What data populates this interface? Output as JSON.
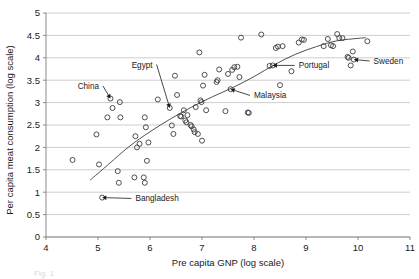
{
  "chart_data": {
    "type": "scatter",
    "title": "",
    "xlabel": "Pre capita GNP (log scale)",
    "ylabel": "Per capita meat consumption (log scale)",
    "xlim": [
      4,
      11
    ],
    "ylim": [
      0,
      5
    ],
    "xticks": [
      "4",
      "5",
      "6",
      "7",
      "8",
      "9",
      "10",
      "11"
    ],
    "yticks": [
      "0",
      "0.5",
      "1",
      "1.5",
      "2",
      "2.5",
      "3",
      "3.5",
      "4",
      "4.5",
      "5"
    ],
    "grid": "horizontal",
    "legend": "none",
    "marker_style": "open-circle",
    "points": [
      [
        4.51,
        1.72
      ],
      [
        4.97,
        2.29
      ],
      [
        5.02,
        1.62
      ],
      [
        5.08,
        0.88
      ],
      [
        5.18,
        2.67
      ],
      [
        5.24,
        3.09
      ],
      [
        5.28,
        2.88
      ],
      [
        5.38,
        1.47
      ],
      [
        5.4,
        1.21
      ],
      [
        5.42,
        3.01
      ],
      [
        5.43,
        2.67
      ],
      [
        5.7,
        1.33
      ],
      [
        5.72,
        2.25
      ],
      [
        5.75,
        2.0
      ],
      [
        5.8,
        2.08
      ],
      [
        5.88,
        1.33
      ],
      [
        5.9,
        2.67
      ],
      [
        5.9,
        1.21
      ],
      [
        5.92,
        2.45
      ],
      [
        5.94,
        1.7
      ],
      [
        5.97,
        2.11
      ],
      [
        6.15,
        3.07
      ],
      [
        6.38,
        2.88
      ],
      [
        6.42,
        2.49
      ],
      [
        6.45,
        2.3
      ],
      [
        6.48,
        3.6
      ],
      [
        6.52,
        3.17
      ],
      [
        6.58,
        2.7
      ],
      [
        6.6,
        2.69
      ],
      [
        6.65,
        2.83
      ],
      [
        6.68,
        2.6
      ],
      [
        6.7,
        2.56
      ],
      [
        6.72,
        2.72
      ],
      [
        6.78,
        2.5
      ],
      [
        6.8,
        2.47
      ],
      [
        6.84,
        2.4
      ],
      [
        6.86,
        2.34
      ],
      [
        6.88,
        2.9
      ],
      [
        6.92,
        2.3
      ],
      [
        6.95,
        4.12
      ],
      [
        6.97,
        3.05
      ],
      [
        6.99,
        3.01
      ],
      [
        7.0,
        2.15
      ],
      [
        7.02,
        3.38
      ],
      [
        7.05,
        3.62
      ],
      [
        7.08,
        2.83
      ],
      [
        7.28,
        3.46
      ],
      [
        7.3,
        3.5
      ],
      [
        7.33,
        3.74
      ],
      [
        7.45,
        2.81
      ],
      [
        7.5,
        3.64
      ],
      [
        7.55,
        3.3
      ],
      [
        7.58,
        3.73
      ],
      [
        7.62,
        3.79
      ],
      [
        7.68,
        3.8
      ],
      [
        7.72,
        3.57
      ],
      [
        7.75,
        4.45
      ],
      [
        7.88,
        2.78
      ],
      [
        7.9,
        2.77
      ],
      [
        8.14,
        4.52
      ],
      [
        8.3,
        3.82
      ],
      [
        8.36,
        3.83
      ],
      [
        8.42,
        4.22
      ],
      [
        8.46,
        4.25
      ],
      [
        8.5,
        3.39
      ],
      [
        8.55,
        4.26
      ],
      [
        8.72,
        3.7
      ],
      [
        8.86,
        4.34
      ],
      [
        8.92,
        4.41
      ],
      [
        8.96,
        4.4
      ],
      [
        9.34,
        4.26
      ],
      [
        9.42,
        4.42
      ],
      [
        9.48,
        4.28
      ],
      [
        9.52,
        4.26
      ],
      [
        9.6,
        4.53
      ],
      [
        9.64,
        4.44
      ],
      [
        9.7,
        4.44
      ],
      [
        9.8,
        4.02
      ],
      [
        9.82,
        4.0
      ],
      [
        9.86,
        3.83
      ],
      [
        9.9,
        4.14
      ],
      [
        9.92,
        3.96
      ],
      [
        10.18,
        4.37
      ]
    ],
    "trend_line": {
      "description": "fitted logarithmic trend curve",
      "points": [
        [
          4.85,
          1.27
        ],
        [
          5.2,
          1.62
        ],
        [
          5.6,
          2.02
        ],
        [
          6.0,
          2.35
        ],
        [
          6.4,
          2.64
        ],
        [
          6.8,
          2.9
        ],
        [
          7.2,
          3.13
        ],
        [
          7.6,
          3.34
        ],
        [
          8.0,
          3.58
        ],
        [
          8.4,
          3.85
        ],
        [
          8.8,
          4.08
        ],
        [
          9.2,
          4.25
        ],
        [
          9.6,
          4.38
        ],
        [
          10.15,
          4.45
        ]
      ]
    },
    "annotations": [
      {
        "label": "China",
        "point": [
          5.24,
          3.09
        ],
        "label_x": 5.02,
        "label_y": 3.37
      },
      {
        "label": "Egypt",
        "point": [
          6.38,
          2.88
        ],
        "label_x": 6.05,
        "label_y": 3.85
      },
      {
        "label": "Malaysia",
        "point": [
          7.55,
          3.3
        ],
        "label_x": 8.0,
        "label_y": 3.16
      },
      {
        "label": "Portugal",
        "point": [
          8.36,
          3.83
        ],
        "label_x": 8.86,
        "label_y": 3.83
      },
      {
        "label": "Sweden",
        "point": [
          9.92,
          3.96
        ],
        "label_x": 10.3,
        "label_y": 3.93
      },
      {
        "label": "Bangladesh",
        "point": [
          5.08,
          0.88
        ],
        "label_x": 5.72,
        "label_y": 0.86
      }
    ]
  },
  "caption": {
    "partial_text": "Fig. 1"
  }
}
